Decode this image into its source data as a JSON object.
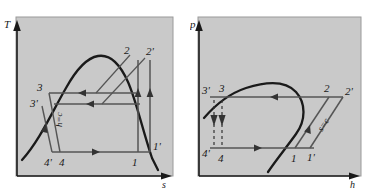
{
  "figure": {
    "kind": "thermodynamic-cycle-diagrams",
    "background_color": "#ffffff",
    "panel_fill": "#c9c9c9",
    "panel_edge": "#8f8f8f",
    "ink_color": "#1a1a1a"
  },
  "panels": [
    {
      "id": "left",
      "name": "temperature-entropy-diagram",
      "axes": {
        "y_label": "T",
        "x_label": "s"
      },
      "curve_name": "saturation-dome",
      "process_label": "h=c",
      "state_points": [
        {
          "label": "3",
          "name": "state-point-3"
        },
        {
          "label": "3'",
          "name": "state-point-3-prime"
        },
        {
          "label": "4",
          "name": "state-point-4"
        },
        {
          "label": "4'",
          "name": "state-point-4-prime"
        },
        {
          "label": "1",
          "name": "state-point-1"
        },
        {
          "label": "1'",
          "name": "state-point-1-prime"
        },
        {
          "label": "2",
          "name": "state-point-2"
        },
        {
          "label": "2'",
          "name": "state-point-2-prime"
        }
      ]
    },
    {
      "id": "right",
      "name": "pressure-enthalpy-diagram",
      "axes": {
        "y_label": "p",
        "x_label": "h"
      },
      "curve_name": "saturation-dome",
      "process_label": "s=c",
      "state_points": [
        {
          "label": "3",
          "name": "state-point-3"
        },
        {
          "label": "3'",
          "name": "state-point-3-prime"
        },
        {
          "label": "4",
          "name": "state-point-4"
        },
        {
          "label": "4'",
          "name": "state-point-4-prime"
        },
        {
          "label": "1",
          "name": "state-point-1"
        },
        {
          "label": "1'",
          "name": "state-point-1-prime"
        },
        {
          "label": "2",
          "name": "state-point-2"
        },
        {
          "label": "2'",
          "name": "state-point-2-prime"
        }
      ]
    }
  ]
}
